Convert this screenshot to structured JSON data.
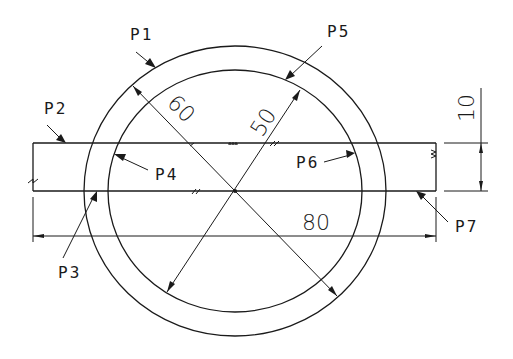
{
  "diagram": {
    "type": "engineering-drawing",
    "colors": {
      "line": "#1a1a1a",
      "background": "#ffffff"
    },
    "labels": {
      "p1": "P1",
      "p2": "P2",
      "p3": "P3",
      "p4": "P4",
      "p5": "P5",
      "p6": "P6",
      "p7": "P7"
    },
    "dimensions": {
      "outer_diameter": "60",
      "inner_diameter": "50",
      "strip_length": "80",
      "strip_height": "10"
    }
  }
}
